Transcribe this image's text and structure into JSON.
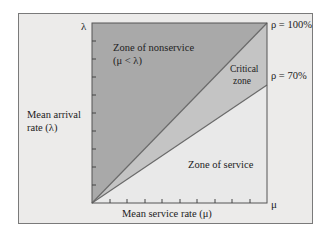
{
  "diagram": {
    "y_axis": {
      "top_label": "λ",
      "title_line1": "Mean arrival",
      "title_line2": "rate (λ)"
    },
    "x_axis": {
      "right_label": "μ",
      "title": "Mean service rate (μ)"
    },
    "zones": {
      "nonservice_line1": "Zone of nonservice",
      "nonservice_line2": "(μ < λ)",
      "critical_line1": "Critical",
      "critical_line2": "zone",
      "service": "Zone of service"
    },
    "lines": {
      "rho100": "ρ = 100%",
      "rho70": "ρ = 70%"
    },
    "colors": {
      "frame_bg": "#ecebea",
      "nonservice": "#a9a9a9",
      "critical": "#c4c4c4",
      "service": "#e9e9e9",
      "line": "#6a6a6a"
    }
  }
}
